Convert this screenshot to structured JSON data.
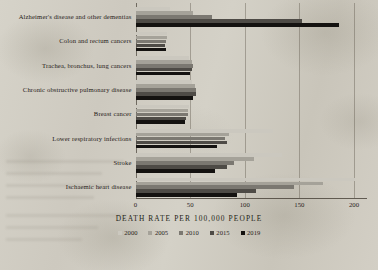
{
  "chart_data": {
    "type": "bar",
    "orientation": "horizontal",
    "title": "",
    "xlabel": "DEATH RATE PER 100,000 PEOPLE",
    "ylabel": "",
    "xlim": [
      0,
      210
    ],
    "xticks": [
      0,
      50,
      100,
      150,
      200
    ],
    "xtick_labels": [
      "0",
      "50",
      "100",
      "150",
      "200"
    ],
    "grid": true,
    "legend_position": "bottom",
    "categories": [
      "Alzheimer's disease and other dementias",
      "Colon and rectum cancers",
      "Trachea, bronchus, lung cancers",
      "Chronic obstructive pulmonary disease",
      "Breast cancer",
      "Lower respiratory infections",
      "Stroke",
      "Ischaemic heart disease"
    ],
    "series": [
      {
        "name": "2000",
        "color": "#cbc8bf",
        "values": [
          32,
          29,
          49,
          52,
          49,
          126,
          134,
          201
        ]
      },
      {
        "name": "2005",
        "color": "#a5a299",
        "values": [
          53,
          29,
          52,
          54,
          48,
          86,
          108,
          172
        ]
      },
      {
        "name": "2010",
        "color": "#7b7871",
        "values": [
          70,
          28,
          53,
          55,
          48,
          82,
          90,
          145
        ]
      },
      {
        "name": "2015",
        "color": "#4e4b46",
        "values": [
          152,
          27,
          52,
          55,
          46,
          84,
          84,
          110
        ]
      },
      {
        "name": "2019",
        "color": "#141210",
        "values": [
          186,
          28,
          50,
          53,
          45,
          75,
          73,
          93
        ]
      }
    ]
  },
  "legend": {
    "entries": [
      "2000",
      "2005",
      "2010",
      "2015",
      "2019"
    ]
  }
}
